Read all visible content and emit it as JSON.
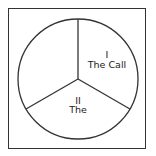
{
  "diagram": {
    "type": "circle-divided-into-three-sections",
    "sections": [
      {
        "numeral": "I",
        "title": "The Call"
      },
      {
        "numeral": "II",
        "title": "The Response"
      },
      {
        "numeral": "III",
        "title": "The Outcome"
      }
    ],
    "colors": {
      "stroke": "#333333",
      "text": "#222222",
      "background": "#ffffff"
    }
  }
}
